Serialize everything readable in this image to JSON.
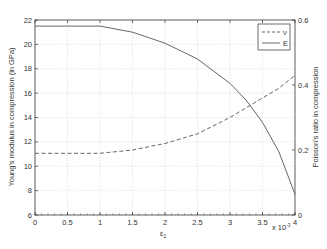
{
  "chart_data": {
    "type": "line",
    "title": "",
    "xlabel": "ε1",
    "ylabel": "Young's modulus in compression (in GPa)",
    "y2label": "Poisson's ratio in compression",
    "x_multiplier": "x 10^-3",
    "xlim": [
      0,
      4
    ],
    "ylim": [
      6,
      22
    ],
    "y2lim": [
      0,
      0.6
    ],
    "grid": true,
    "legend_position": "upper right",
    "x_ticks": [
      "0",
      "0.5",
      "1",
      "1.5",
      "2",
      "2.5",
      "3",
      "3.5",
      "4"
    ],
    "y_ticks": [
      "6",
      "8",
      "10",
      "12",
      "14",
      "16",
      "18",
      "20",
      "22"
    ],
    "y2_ticks": [
      "0",
      "0.2",
      "0.4",
      "0.6"
    ],
    "x": [
      0,
      0.5,
      1,
      1.5,
      2,
      2.5,
      3,
      3.25,
      3.5,
      3.75,
      4
    ],
    "series": [
      {
        "name": "ν",
        "axis": "right",
        "style": "dashed",
        "values": [
          0.19,
          0.19,
          0.19,
          0.2,
          0.22,
          0.25,
          0.3,
          0.33,
          0.36,
          0.39,
          0.43
        ]
      },
      {
        "name": "E",
        "axis": "left",
        "style": "solid",
        "values": [
          21.5,
          21.5,
          21.5,
          21.0,
          20.1,
          18.8,
          16.8,
          15.4,
          13.6,
          11.2,
          7.7
        ]
      }
    ]
  },
  "legend": {
    "items": [
      {
        "label": "ν",
        "style": "dashed"
      },
      {
        "label": "E",
        "style": "solid"
      }
    ]
  },
  "labels": {
    "xlabel_main": "ε",
    "xlabel_sub": "1",
    "ylabel": "Young's modulus in compression (in GPa)",
    "y2label": "Poisson's ratio in compression",
    "x_multiplier_base": "x 10",
    "x_multiplier_exp": "-3"
  },
  "colors": {
    "line": "#555555",
    "grid": "#cccccc",
    "axis": "#333333"
  }
}
